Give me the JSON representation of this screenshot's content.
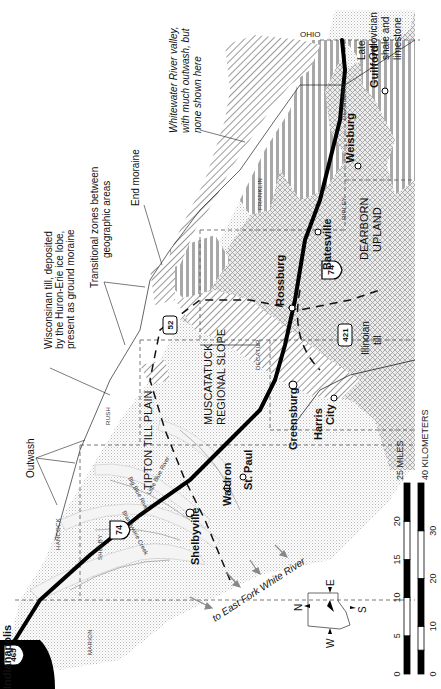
{
  "map": {
    "title_city": "Indianapolis",
    "orientation_note": "map rotated 90 degrees; north points left",
    "colors": {
      "ground_moraine": "#d9d9d9",
      "illinoian_till": "#bdbdbd",
      "end_moraine_hatch": "#555555",
      "ordovician_stripes": "#a8a8a8",
      "highway": "#000000",
      "outwash": "#f2f2f2"
    },
    "highways": [
      {
        "shield": "465",
        "type": "interstate"
      },
      {
        "shield": "74",
        "type": "interstate"
      },
      {
        "shield": "52",
        "type": "us"
      },
      {
        "shield": "421",
        "type": "us"
      }
    ],
    "towns": [
      {
        "name": "Shelbyville"
      },
      {
        "name": "Waldron"
      },
      {
        "name": "St. Paul"
      },
      {
        "name": "Greensburg"
      },
      {
        "name": "Harris City"
      },
      {
        "name": "Rossburg"
      },
      {
        "name": "Batesville"
      },
      {
        "name": "Weisburg"
      },
      {
        "name": "Guilford"
      }
    ],
    "counties": [
      "MARION",
      "HANCOCK",
      "SHELBY",
      "RUSH",
      "DECATUR",
      "FRANKLIN",
      "RIPLEY",
      "DEARBORN"
    ],
    "state_label": "OHIO",
    "regions": {
      "tipton": "TIPTON TILL PLAIN",
      "muscatatuck_1": "MUSCATATUCK",
      "muscatatuck_2": "REGIONAL SLOPE",
      "dearborn_1": "DEARBORN",
      "dearborn_2": "UPLAND"
    },
    "streams": [
      "Little Blue River",
      "Big Blue River",
      "Brandywine Creek"
    ],
    "annotations": {
      "outwash": "Outwash",
      "wisconsinan": [
        "Wisconsinan till, deposited",
        "by the Huron-Erie ice lobe,",
        "present as ground moraine"
      ],
      "transitional": [
        "Transitional zones between",
        "geographic areas"
      ],
      "end_moraine": "End moraine",
      "whitewater": [
        "Whitewater River valley,",
        "with much outwash, but",
        "none shown here"
      ],
      "ordovician": [
        "Late",
        "Ordovician",
        "shale and",
        "limestone"
      ],
      "illinoian": [
        "Illinoian",
        "till"
      ],
      "east_fork": "to East Fork White River"
    },
    "compass": {
      "n": "N",
      "e": "E",
      "s": "S",
      "w": "W"
    },
    "scale": {
      "miles_label": "25 MILES",
      "miles_ticks": [
        "0",
        "5",
        "10",
        "15",
        "20"
      ],
      "km_label": "40 KILOMETERS",
      "km_ticks": [
        "0",
        "10",
        "20",
        "30"
      ]
    }
  }
}
